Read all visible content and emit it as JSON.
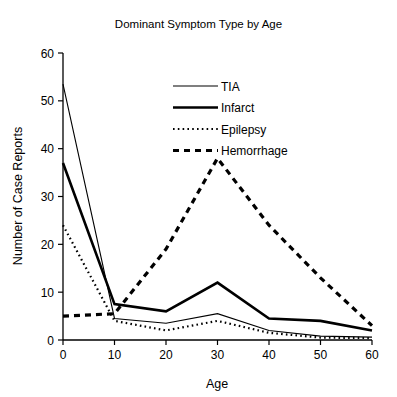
{
  "chart_data": {
    "type": "line",
    "title": "Dominant Symptom Type by Age",
    "xlabel": "Age",
    "ylabel": "Number of Case Reports",
    "x": [
      0,
      10,
      20,
      30,
      40,
      50,
      60
    ],
    "xlim": [
      0,
      60
    ],
    "ylim": [
      0,
      60
    ],
    "xticks": [
      "0",
      "10",
      "20",
      "30",
      "40",
      "50",
      "60"
    ],
    "yticks": [
      "0",
      "10",
      "20",
      "30",
      "40",
      "50",
      "60"
    ],
    "grid": false,
    "legend_position": "upper center",
    "series": [
      {
        "name": "TIA",
        "style": "thin-solid",
        "values": [
          53.5,
          4.5,
          3.5,
          5.5,
          2.0,
          0.8,
          0.6
        ]
      },
      {
        "name": "Infarct",
        "style": "thick-solid",
        "values": [
          37.0,
          7.5,
          6.0,
          12.0,
          4.5,
          4.0,
          2.0
        ]
      },
      {
        "name": "Epilepsy",
        "style": "fine-dotted",
        "values": [
          24.0,
          4.0,
          2.0,
          4.0,
          1.5,
          0.5,
          0.4
        ]
      },
      {
        "name": "Hemorrhage",
        "style": "thick-dashed",
        "values": [
          5.0,
          5.5,
          19.0,
          38.0,
          24.0,
          13.0,
          3.0
        ]
      }
    ]
  },
  "legend": {
    "items": [
      {
        "label": "TIA"
      },
      {
        "label": "Infarct"
      },
      {
        "label": "Epilepsy"
      },
      {
        "label": "Hemorrhage"
      }
    ]
  }
}
